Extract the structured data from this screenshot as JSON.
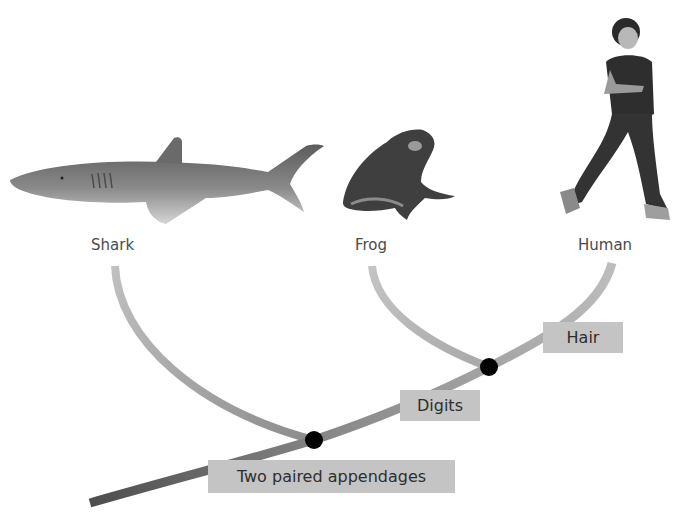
{
  "diagram": {
    "type": "cladogram",
    "taxa": [
      {
        "name": "Shark",
        "icon": "shark-illustration"
      },
      {
        "name": "Frog",
        "icon": "frog-illustration"
      },
      {
        "name": "Human",
        "icon": "human-runner-illustration"
      }
    ],
    "traits": [
      {
        "label": "Two paired appendages"
      },
      {
        "label": "Digits"
      },
      {
        "label": "Hair"
      }
    ],
    "colors": {
      "branch_dark": "#555555",
      "branch_light": "#b8b8b8",
      "node": "#000000",
      "trait_box": "#c4c4c4",
      "label_text": "#4a4a4a"
    }
  }
}
